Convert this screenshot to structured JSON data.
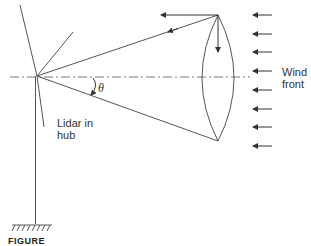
{
  "figure": {
    "labels": {
      "theta": "θ",
      "lidar": [
        "Lidar in",
        "hub"
      ],
      "wind": [
        "Wind",
        "front"
      ]
    },
    "caption_fragment": "FIGURE",
    "colors": {
      "line": "#555555",
      "arrow": "#333333",
      "centerline": "#777777"
    },
    "wind_arrow_count": 8
  }
}
